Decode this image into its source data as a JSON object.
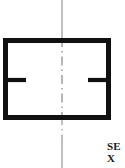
{
  "figure": {
    "type": "technical-line-drawing",
    "background_color": "#ffffff",
    "ink_color": "#111111",
    "centerline_color": "#8d8d8d",
    "canvas": {
      "width": 125,
      "height": 168
    }
  },
  "outline": {
    "shape": "rectangle",
    "x": 3,
    "y": 38,
    "width": 108,
    "height": 82,
    "stroke_width": 5
  },
  "notches": [
    {
      "name": "left-notch",
      "side": "left",
      "x_start": 3,
      "x_end": 26,
      "y": 79,
      "thickness": 4
    },
    {
      "name": "right-notch",
      "side": "right",
      "x_start": 88,
      "x_end": 111,
      "y": 79,
      "thickness": 4
    }
  ],
  "centerline": {
    "orientation": "vertical",
    "x": 62,
    "y_top": 0,
    "y_bottom": 168,
    "stroke_width": 1,
    "pattern": "dash-dot",
    "solid_segments": [
      {
        "y1": 0,
        "y2": 38
      },
      {
        "y1": 138,
        "y2": 168
      }
    ],
    "dash_dot_segments": [
      {
        "y1": 38,
        "y2": 120
      },
      {
        "y1": 120,
        "y2": 138
      }
    ]
  },
  "labels": {
    "section_label": {
      "name": "section-label",
      "lines": [
        "SE",
        "X"
      ],
      "full_text_visible": "SE X",
      "truncated": true,
      "x": 109,
      "y": 142,
      "font_size": 11,
      "font_weight": "bold"
    }
  }
}
